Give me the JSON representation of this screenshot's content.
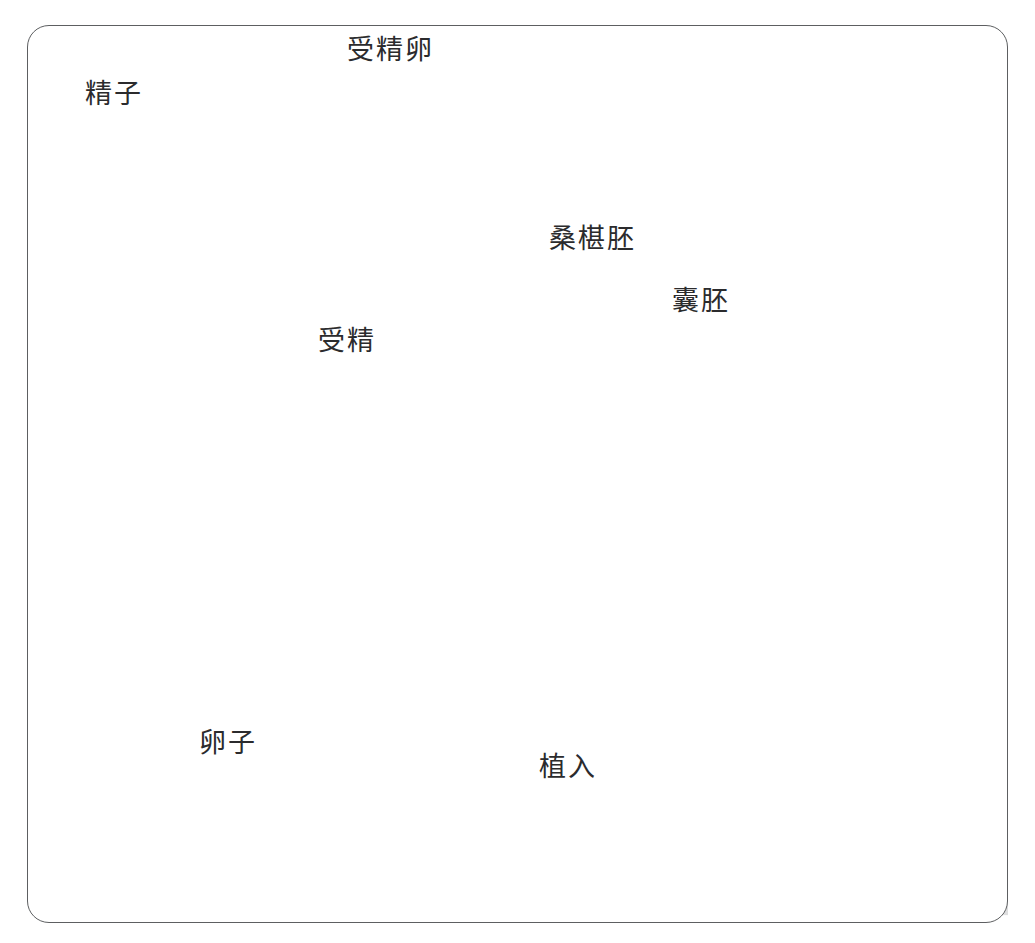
{
  "figure": {
    "kind": "anatomical-illustration",
    "palette": {
      "background": "#ffffff",
      "frame_border": "#5d5f61",
      "label_text": "#2b2b2d",
      "leader_line": "#3a3a3c",
      "tube_mid": "#8b8d90",
      "tube_dark": "#5a5c5f",
      "tube_light": "#c4c6c9",
      "ovary_stroma": "#e8e8e6",
      "ovary_capsule": "#9a9c9f",
      "uterus_wall": "#9fa1a4",
      "uterus_dark": "#6d6f72",
      "endometrium": "#b9bbbe",
      "cell_dark": "#45474a"
    }
  },
  "labels": [
    {
      "id": "sperm",
      "text": "精子",
      "x": 85,
      "y": 80,
      "anchor": "left"
    },
    {
      "id": "zygote",
      "text": "受精卵",
      "x": 347,
      "y": 36,
      "anchor": "left"
    },
    {
      "id": "fertilization",
      "text": "受精",
      "x": 318,
      "y": 327,
      "anchor": "left"
    },
    {
      "id": "morula",
      "text": "桑椹胚",
      "x": 549,
      "y": 225,
      "anchor": "left"
    },
    {
      "id": "blastocyst",
      "text": "囊胚",
      "x": 672,
      "y": 287,
      "anchor": "left"
    },
    {
      "id": "ovum",
      "text": "卵子",
      "x": 199,
      "y": 729,
      "anchor": "left"
    },
    {
      "id": "implantation",
      "text": "植入",
      "x": 539,
      "y": 753,
      "anchor": "left"
    }
  ],
  "structures": [
    {
      "id": "fallopian-tube",
      "name": "输卵管"
    },
    {
      "id": "fimbriae",
      "name": "输卵管伞"
    },
    {
      "id": "ovary",
      "name": "卵巢"
    },
    {
      "id": "ovarian-follicles",
      "name": "卵泡",
      "count": 5
    },
    {
      "id": "uterus",
      "name": "子宫"
    },
    {
      "id": "endometrium",
      "name": "子宫内膜"
    },
    {
      "id": "sperm-cluster",
      "name": "精子群"
    },
    {
      "id": "two-cell-stage",
      "name": "二细胞期受精卵"
    },
    {
      "id": "four-cell-stage",
      "name": "四细胞期受精卵"
    },
    {
      "id": "morula-stage",
      "name": "桑椹胚"
    },
    {
      "id": "blastocyst-stage",
      "name": "囊胚"
    },
    {
      "id": "implanting-embryo",
      "name": "着床中的胚泡"
    }
  ]
}
